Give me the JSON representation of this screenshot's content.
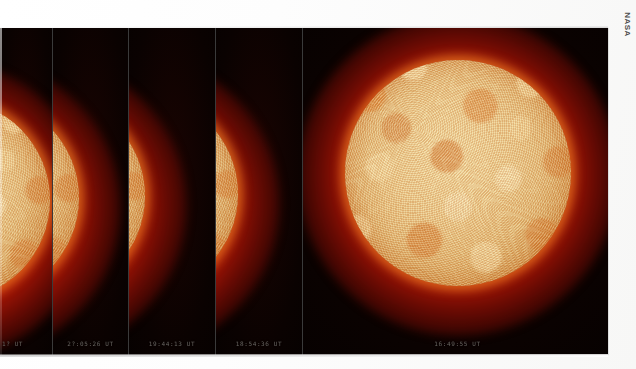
{
  "figure": {
    "credit": "NASA",
    "background_color": "#ffffff",
    "frame_background_color": "#000000",
    "corona_color": "#c41a06",
    "disk_color": "#e4bf7c",
    "divider_color": "#3a3a3a"
  },
  "panels": [
    {
      "name": "frame-1",
      "timestamp": "1? UT"
    },
    {
      "name": "frame-2",
      "timestamp": "2?:05:26 UT"
    },
    {
      "name": "frame-3",
      "timestamp": "19:44:13 UT"
    },
    {
      "name": "frame-4",
      "timestamp": "18:54:36 UT"
    },
    {
      "name": "frame-5",
      "timestamp": "16:49:55 UT"
    }
  ],
  "credit_label": "NASA"
}
